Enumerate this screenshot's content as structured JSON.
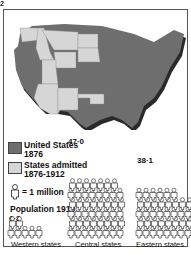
{
  "figure_number": "2",
  "colors": {
    "us_1876": "#6e6e6e",
    "admitted_1876_1912": "#d6d6d6",
    "person": "#ffffff",
    "outline": "#222222"
  },
  "legend": {
    "items": [
      {
        "label_line1": "United States",
        "label_line2": "1876",
        "swatch": "us_1876"
      },
      {
        "label_line1": "States admitted",
        "label_line2": "1876-1912",
        "swatch": "admitted_1876_1912"
      }
    ],
    "person_key": "= 1 million"
  },
  "population": {
    "title": "Population 1910",
    "unit": "million",
    "groups": [
      {
        "name": "Western states",
        "value": 6.8,
        "value_label": "6·8"
      },
      {
        "name": "Central states",
        "value": 47.0,
        "value_label": "47·0"
      },
      {
        "name": "Eastern states",
        "value": 38.1,
        "value_label": "38·1"
      }
    ]
  },
  "map": {
    "title": "United States 1876 and States admitted 1876-1912",
    "admitted_states": [
      "Washington",
      "Idaho",
      "Montana",
      "North Dakota",
      "South Dakota",
      "Wyoming",
      "Utah",
      "Arizona",
      "New Mexico",
      "Oklahoma"
    ]
  }
}
